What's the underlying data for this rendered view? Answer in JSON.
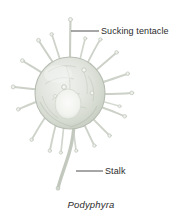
{
  "figure": {
    "title": "Podyphyra",
    "background_color": "#ffffff",
    "width": 182,
    "height": 221
  },
  "caption": {
    "text": "Podyphyra",
    "style": "italic"
  },
  "labels": [
    {
      "id": "sucking-tentacle",
      "text": "Sucking tentacle",
      "text_color": "#2b2b2b",
      "leader_line": {
        "x1": 71,
        "y1": 31,
        "x2": 99,
        "y2": 31
      }
    },
    {
      "id": "stalk",
      "text": "Stalk",
      "text_color": "#2b2b2b",
      "leader_line": {
        "x1": 76,
        "y1": 171,
        "x2": 103,
        "y2": 171
      }
    }
  ],
  "organism": {
    "name": "Podyphyra",
    "body": {
      "shape": "round-cell",
      "center_x": 70,
      "center_y": 93,
      "radius_x": 35,
      "radius_y": 36,
      "fill_color": "#e3e6e0",
      "outline_color": "#b9bfb6",
      "nucleus_color": "#f2f3ef"
    },
    "tentacles": {
      "count": 19,
      "color": "#cdd2c9",
      "tip_color": "#e8eae5",
      "description": "radiating sucking tentacles with knobbed tips"
    },
    "stalk": {
      "color": "#ced3ca",
      "description": "curved tapering stalk extending downward from cell body"
    }
  },
  "colors": {
    "background": "#ffffff",
    "ink": "#2b2b2b",
    "body_fill": "#e3e6e0",
    "body_shade": "#c9cfc4",
    "tentacle": "#cdd2c9"
  }
}
